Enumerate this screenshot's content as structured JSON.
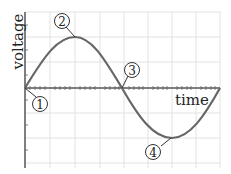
{
  "axes": {
    "y_label": "voltage",
    "x_label": "time"
  },
  "markers": [
    {
      "id": "1",
      "label": "1",
      "point": "origin / zero crossing"
    },
    {
      "id": "2",
      "label": "2",
      "point": "positive peak"
    },
    {
      "id": "3",
      "label": "3",
      "point": "zero crossing"
    },
    {
      "id": "4",
      "label": "4",
      "point": "negative peak"
    }
  ],
  "colors": {
    "curve": "#666666",
    "axis": "#555555",
    "grid": "#e2e2e2",
    "marker_border": "#333333"
  }
}
